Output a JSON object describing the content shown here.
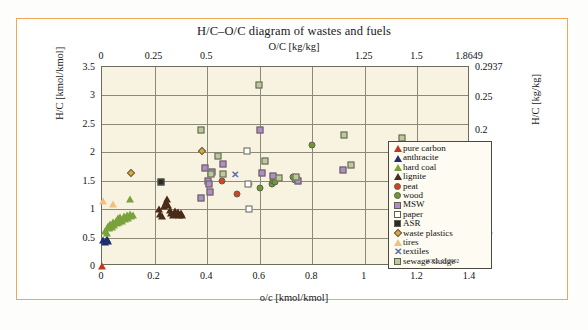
{
  "figure": {
    "title": "H/C–O/C diagram of wastes and fuels",
    "stamp": "WJ51. 11/2002",
    "caption": "",
    "accent_color": "#f5a242",
    "plot_background": "#f8f3e1",
    "grid_color": "#8a8a76"
  },
  "chart_data": {
    "type": "scatter",
    "title": "H/C–O/C diagram of wastes and fuels",
    "xlabel": "o/c [kmol/kmol]",
    "ylabel": "H/C [kmol/kmol]",
    "xlabel_top": "O/C [kg/kg]",
    "ylabel_right": "H/C [kg/kg]",
    "xlim": [
      0,
      1.4
    ],
    "ylim": [
      0,
      3.5
    ],
    "xlim_top": [
      0,
      1.8649
    ],
    "ylim_right": [
      0,
      0.2937
    ],
    "grid": true,
    "legend_position": "center-right",
    "xticks_bottom": [
      "0",
      "0.2",
      "0.4",
      "0.6",
      "0.8",
      "1",
      "1.2",
      "1.4"
    ],
    "xtick_values_bottom": [
      0,
      0.2,
      0.4,
      0.6,
      0.8,
      1.0,
      1.2,
      1.4
    ],
    "xticks_top": [
      "0",
      "0.25",
      "0.5",
      "",
      "",
      "1.25",
      "1.5",
      "1.8649"
    ],
    "xtick_values_top": [
      0,
      0.25,
      0.5,
      0.75,
      1.0,
      1.25,
      1.5,
      1.8649
    ],
    "yticks_left": [
      "3.5",
      "3",
      "2.5",
      "2",
      "1.5",
      "1",
      "0.5",
      "0"
    ],
    "ytick_values_left": [
      3.5,
      3,
      2.5,
      2,
      1.5,
      1,
      0.5,
      0
    ],
    "yticks_right": [
      "0.2937",
      "0.25",
      "0.2",
      "",
      "0.1",
      "0.05",
      "0"
    ],
    "ytick_values_right": [
      0.2937,
      0.25,
      0.2,
      0.15,
      0.1,
      0.05,
      0
    ],
    "series": [
      {
        "name": "pure carbon",
        "marker": "triangle",
        "color": "#c0391b",
        "points": [
          [
            0.0,
            0.0
          ]
        ]
      },
      {
        "name": "anthracite",
        "marker": "triangle",
        "color": "#1f2f6e",
        "points": [
          [
            0.005,
            0.45
          ],
          [
            0.012,
            0.42
          ],
          [
            0.018,
            0.47
          ],
          [
            0.024,
            0.44
          ]
        ]
      },
      {
        "name": "hard coal",
        "marker": "triangle",
        "color": "#7aa23c",
        "points": [
          [
            0.012,
            0.62
          ],
          [
            0.018,
            0.58
          ],
          [
            0.022,
            0.7
          ],
          [
            0.028,
            0.66
          ],
          [
            0.032,
            0.74
          ],
          [
            0.038,
            0.68
          ],
          [
            0.042,
            0.78
          ],
          [
            0.046,
            0.72
          ],
          [
            0.052,
            0.8
          ],
          [
            0.056,
            0.76
          ],
          [
            0.06,
            0.84
          ],
          [
            0.066,
            0.78
          ],
          [
            0.07,
            0.86
          ],
          [
            0.076,
            0.8
          ],
          [
            0.082,
            0.88
          ],
          [
            0.088,
            0.82
          ],
          [
            0.094,
            0.9
          ],
          [
            0.1,
            0.85
          ],
          [
            0.106,
            0.92
          ],
          [
            0.112,
            0.88
          ],
          [
            0.118,
            0.9
          ],
          [
            0.108,
            1.18
          ]
        ]
      },
      {
        "name": "lignite",
        "marker": "triangle",
        "color": "#4a2a18",
        "points": [
          [
            0.215,
            1.0
          ],
          [
            0.222,
            0.92
          ],
          [
            0.228,
            0.88
          ],
          [
            0.236,
            1.05
          ],
          [
            0.242,
            1.12
          ],
          [
            0.248,
            1.18
          ],
          [
            0.252,
            1.08
          ],
          [
            0.258,
            0.98
          ],
          [
            0.264,
            0.94
          ],
          [
            0.27,
            0.9
          ],
          [
            0.276,
            0.96
          ],
          [
            0.282,
            0.92
          ],
          [
            0.288,
            0.95
          ],
          [
            0.294,
            0.9
          ],
          [
            0.3,
            0.93
          ],
          [
            0.306,
            0.9
          ]
        ]
      },
      {
        "name": "peat",
        "marker": "circle",
        "color": "#d9401f",
        "points": [
          [
            0.455,
            1.5
          ],
          [
            0.515,
            1.26
          ]
        ]
      },
      {
        "name": "wood",
        "marker": "circle",
        "color": "#6a9b2e",
        "points": [
          [
            0.602,
            1.38
          ],
          [
            0.645,
            1.44
          ],
          [
            0.65,
            1.5
          ],
          [
            0.655,
            1.55
          ],
          [
            0.66,
            1.47
          ],
          [
            0.665,
            1.54
          ],
          [
            0.728,
            1.56
          ],
          [
            0.735,
            1.52
          ],
          [
            0.742,
            1.55
          ],
          [
            0.8,
            2.12
          ],
          [
            0.56,
            1.44
          ]
        ]
      },
      {
        "name": "MSW",
        "marker": "square",
        "color": "#b08ec4",
        "points": [
          [
            0.378,
            1.2
          ],
          [
            0.392,
            1.73
          ],
          [
            0.405,
            1.5
          ],
          [
            0.408,
            1.44
          ],
          [
            0.412,
            1.3
          ],
          [
            0.418,
            1.66
          ],
          [
            0.462,
            1.8
          ],
          [
            0.6,
            2.4
          ],
          [
            0.608,
            1.64
          ],
          [
            0.652,
            1.59
          ],
          [
            0.745,
            1.5
          ],
          [
            0.918,
            1.68
          ]
        ]
      },
      {
        "name": "paper",
        "marker": "square",
        "color": "#ffffff",
        "points": [
          [
            0.552,
            2.02
          ],
          [
            0.556,
            1.45
          ],
          [
            0.558,
            1.0
          ]
        ]
      },
      {
        "name": "ASR",
        "marker": "square",
        "color": "#2b2b2b",
        "points": [
          [
            0.225,
            1.48
          ]
        ]
      },
      {
        "name": "waste plastics",
        "marker": "diamond",
        "color": "#e0a83c",
        "points": [
          [
            0.112,
            1.64
          ],
          [
            0.38,
            2.02
          ]
        ]
      },
      {
        "name": "tires",
        "marker": "triangle",
        "color": "#f0c080",
        "points": [
          [
            0.004,
            1.14
          ],
          [
            0.042,
            1.09
          ]
        ]
      },
      {
        "name": "textiles",
        "marker": "x",
        "color": "#5b6fae",
        "points": [
          [
            0.505,
            1.62
          ]
        ]
      },
      {
        "name": "sewage sludge",
        "marker": "square",
        "color": "#bcc99a",
        "points": [
          [
            0.375,
            2.4
          ],
          [
            0.415,
            1.62
          ],
          [
            0.442,
            1.94
          ],
          [
            0.462,
            1.62
          ],
          [
            0.598,
            3.19
          ],
          [
            0.622,
            1.85
          ],
          [
            0.672,
            1.55
          ],
          [
            0.738,
            1.56
          ],
          [
            0.922,
            2.31
          ],
          [
            0.948,
            1.78
          ],
          [
            1.142,
            2.25
          ]
        ]
      }
    ]
  },
  "legend": {
    "items": [
      {
        "label": "pure carbon",
        "marker": "triangle",
        "color": "#c0391b"
      },
      {
        "label": "anthracite",
        "marker": "triangle",
        "color": "#1f2f6e"
      },
      {
        "label": "hard coal",
        "marker": "triangle",
        "color": "#7aa23c"
      },
      {
        "label": "lignite",
        "marker": "triangle",
        "color": "#4a2a18"
      },
      {
        "label": "peat",
        "marker": "circle",
        "color": "#d9401f"
      },
      {
        "label": "wood",
        "marker": "circle",
        "color": "#6a9b2e"
      },
      {
        "label": "MSW",
        "marker": "square",
        "color": "#b08ec4"
      },
      {
        "label": "paper",
        "marker": "square",
        "color": "#ffffff"
      },
      {
        "label": "ASR",
        "marker": "square",
        "color": "#2b2b2b"
      },
      {
        "label": "waste plastics",
        "marker": "diamond",
        "color": "#e0a83c"
      },
      {
        "label": "tires",
        "marker": "triangle",
        "color": "#f0c080"
      },
      {
        "label": "textiles",
        "marker": "x",
        "color": "#5b6fae"
      },
      {
        "label": "sewage sludge",
        "marker": "square",
        "color": "#bcc99a"
      }
    ]
  }
}
